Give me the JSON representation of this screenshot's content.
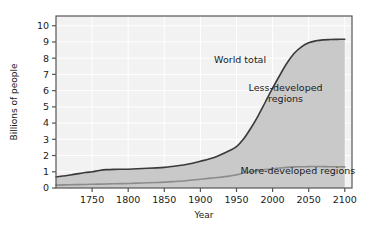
{
  "chart_data": {
    "type": "area",
    "title": "",
    "xlabel": "Year",
    "ylabel": "Billions of people",
    "xlim": [
      1700,
      2110
    ],
    "ylim": [
      0,
      10.6
    ],
    "grid": true,
    "legend_position": "inline-annotations",
    "xticks": [
      1750,
      1800,
      1850,
      1900,
      1950,
      2000,
      2050,
      2100
    ],
    "xtick_labels": [
      "1750",
      "1800",
      "1850",
      "1900",
      "1950",
      "2000",
      "2050",
      "2100"
    ],
    "yticks": [
      0,
      1,
      2,
      3,
      4,
      5,
      6,
      7,
      8,
      9,
      10
    ],
    "ytick_labels": [
      "0",
      "1",
      "2",
      "3",
      "4",
      "5",
      "6",
      "7",
      "8",
      "9",
      "10"
    ],
    "annotations": [
      {
        "text": "World total",
        "x": 1955,
        "y": 7.7
      },
      {
        "text": "Less-developed",
        "x": 2018,
        "y": 6.0
      },
      {
        "text": "regions",
        "x": 2018,
        "y": 5.3
      },
      {
        "text": "More-developed regions",
        "x": 2035,
        "y": 0.85
      }
    ],
    "x": [
      1700,
      1720,
      1740,
      1750,
      1760,
      1770,
      1780,
      1800,
      1820,
      1840,
      1850,
      1860,
      1880,
      1900,
      1920,
      1940,
      1950,
      1960,
      1970,
      1980,
      1990,
      2000,
      2010,
      2020,
      2030,
      2040,
      2050,
      2060,
      2070,
      2080,
      2090,
      2100
    ],
    "series": [
      {
        "name": "World total",
        "values": [
          0.68,
          0.8,
          0.95,
          1.0,
          1.08,
          1.13,
          1.15,
          1.16,
          1.2,
          1.24,
          1.27,
          1.32,
          1.45,
          1.65,
          1.9,
          2.3,
          2.55,
          3.03,
          3.7,
          4.45,
          5.3,
          6.15,
          6.95,
          7.7,
          8.3,
          8.7,
          8.95,
          9.07,
          9.13,
          9.15,
          9.16,
          9.17
        ]
      },
      {
        "name": "More-developed regions",
        "values": [
          0.18,
          0.2,
          0.22,
          0.23,
          0.24,
          0.25,
          0.26,
          0.28,
          0.31,
          0.34,
          0.36,
          0.39,
          0.45,
          0.54,
          0.63,
          0.73,
          0.81,
          0.92,
          1.0,
          1.08,
          1.14,
          1.19,
          1.23,
          1.27,
          1.3,
          1.31,
          1.32,
          1.32,
          1.32,
          1.31,
          1.31,
          1.3
        ]
      },
      {
        "name": "Less-developed regions",
        "values": [
          0.5,
          0.6,
          0.73,
          0.77,
          0.84,
          0.88,
          0.89,
          0.88,
          0.89,
          0.9,
          0.91,
          0.93,
          1.0,
          1.11,
          1.27,
          1.57,
          1.74,
          2.11,
          2.7,
          3.37,
          4.16,
          4.96,
          5.72,
          6.43,
          7.0,
          7.39,
          7.63,
          7.75,
          7.81,
          7.84,
          7.85,
          7.87
        ]
      }
    ]
  },
  "colors": {
    "plot_background": "#f2f2f2",
    "fill": "#c9c9c9",
    "world_line": "#3a3a3a",
    "inner_line": "#8c8c8c",
    "grid": "#ffffff",
    "frame": "#555555",
    "text": "#1a1a1a",
    "page_background": "#ffffff"
  }
}
